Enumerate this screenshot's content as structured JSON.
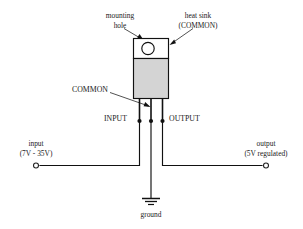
{
  "diagram": {
    "annotations": {
      "mounting_hole_line1": "mounting",
      "mounting_hole_line2": "hole",
      "heat_sink_line1": "heat sink",
      "heat_sink_line2": "(COMMON)",
      "common": "COMMON",
      "input_pin": "INPUT",
      "output_pin": "OUTPUT"
    },
    "terminals": {
      "input_line1": "input",
      "input_line2": "(7V - 35V)",
      "output_line1": "output",
      "output_line2": "(5V regulated)",
      "ground": "ground"
    },
    "colors": {
      "line": "#111111",
      "body_fill": "#d4d4d4",
      "tab_fill": "#ffffff",
      "background": "#ffffff",
      "text": "#1a1a1a",
      "leader": "#333333"
    }
  }
}
